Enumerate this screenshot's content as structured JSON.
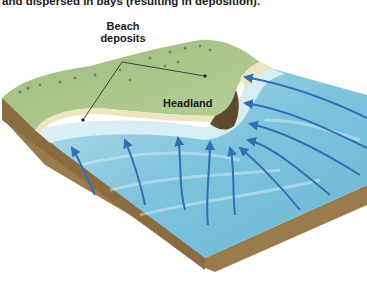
{
  "caption": "and dispersed in bays (resulting in deposition).",
  "labels": {
    "beach_deposits_line1": "Beach",
    "beach_deposits_line2": "deposits",
    "headland": "Headland"
  },
  "colors": {
    "land_green": "#a7c48a",
    "land_dark_green": "#7fa266",
    "beach_sand": "#ece6c0",
    "water_light": "#cfe8f0",
    "water": "#7ec3dc",
    "water_deep": "#5fb0d2",
    "arrow_blue": "#2f6fb5",
    "soil_brown": "#9b7b4c",
    "soil_dark": "#6e5634"
  },
  "diagram": {
    "type": "block-diagram",
    "arrows_into_headland": 5,
    "arrows_into_bay": 5
  }
}
